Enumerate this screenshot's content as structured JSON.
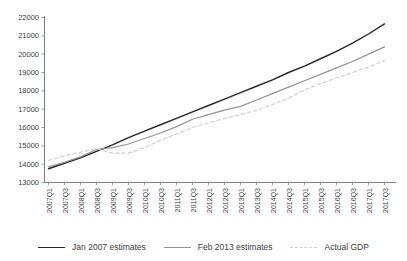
{
  "chart_data": {
    "type": "line",
    "title": "",
    "xlabel": "",
    "ylabel": "",
    "grid": false,
    "legend_position": "bottom",
    "axis_color": "#808080",
    "label_color": "#404040",
    "ylim": [
      13000,
      22000
    ],
    "y_ticks": [
      13000,
      14000,
      15000,
      16000,
      17000,
      18000,
      19000,
      20000,
      21000,
      22000
    ],
    "categories": [
      "2007Q1",
      "2007Q3",
      "2008Q1",
      "2008Q3",
      "2009Q1",
      "2009Q3",
      "2010Q1",
      "2010Q3",
      "2011Q1",
      "2011Q3",
      "2012Q1",
      "2012Q3",
      "2013Q1",
      "2013Q3",
      "2014Q1",
      "2014Q3",
      "2015Q1",
      "2015Q3",
      "2016Q1",
      "2016Q3",
      "2017Q1",
      "2017Q3"
    ],
    "series": [
      {
        "name": "Jan 2007 estimates",
        "color": "#262626",
        "style": "solid",
        "width": 1.4,
        "values": [
          13750,
          14050,
          14350,
          14700,
          15050,
          15450,
          15800,
          16150,
          16500,
          16850,
          17200,
          17550,
          17900,
          18250,
          18600,
          19000,
          19350,
          19750,
          20150,
          20600,
          21100,
          21650
        ]
      },
      {
        "name": "Feb 2013 estimates",
        "color": "#949494",
        "style": "solid",
        "width": 1.2,
        "values": [
          13850,
          14100,
          14400,
          14800,
          14900,
          15100,
          15400,
          15700,
          16050,
          16450,
          16700,
          16950,
          17150,
          17500,
          17850,
          18200,
          18550,
          18900,
          19250,
          19600,
          20000,
          20400
        ]
      },
      {
        "name": "Actual GDP",
        "color": "#cfcfcf",
        "style": "dashed",
        "width": 1.2,
        "values": [
          14200,
          14450,
          14650,
          14850,
          14600,
          14600,
          14900,
          15300,
          15650,
          16000,
          16250,
          16500,
          16700,
          16950,
          17250,
          17600,
          18050,
          18400,
          18700,
          19000,
          19300,
          19650
        ]
      }
    ]
  }
}
